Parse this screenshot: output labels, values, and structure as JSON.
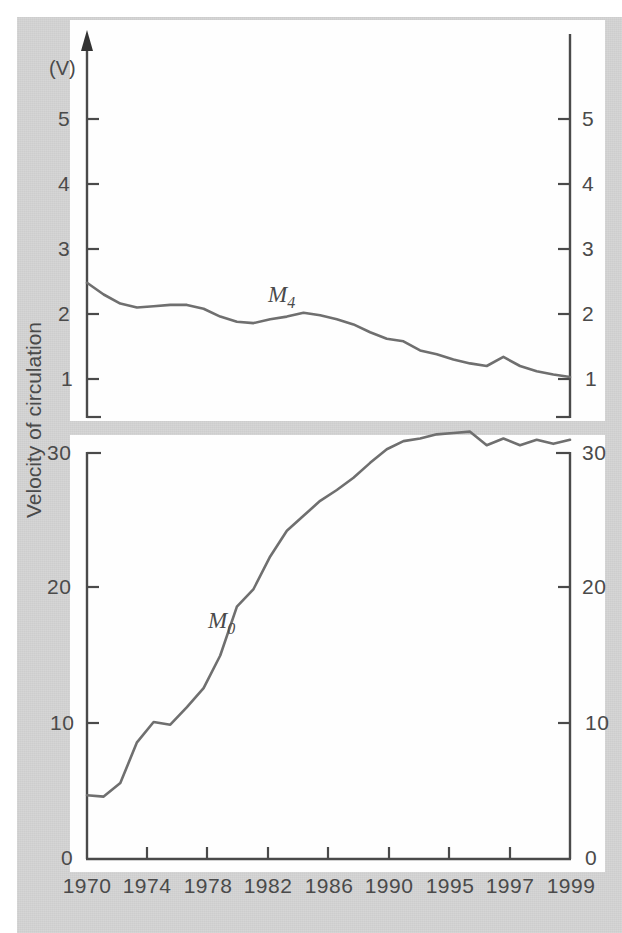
{
  "figure": {
    "y_axis_title": "Velocity of circulation",
    "unit_label": "(V)",
    "series_labels": {
      "m4": "M",
      "m4_sub": "4",
      "m0": "M",
      "m0_sub": "0"
    }
  },
  "axes": {
    "upper_y_ticks": [
      "5",
      "4",
      "3",
      "2",
      "1"
    ],
    "lower_y_ticks": [
      "30",
      "20",
      "10",
      "0"
    ],
    "x_ticks": [
      "1970",
      "1974",
      "1978",
      "1982",
      "1986",
      "1990",
      "1995",
      "1997",
      "1999"
    ]
  },
  "colors": {
    "paper": "#d4d4d4",
    "plot_background": "#fefefe",
    "axis": "#4a4a4a",
    "line": "#6f6f6f",
    "text": "#4a4a4a"
  },
  "chart_data": {
    "type": "line",
    "title": "",
    "xlabel": "",
    "ylabel": "Velocity of circulation",
    "unit": "(V)",
    "grid": false,
    "legend": "inline-labels",
    "broken_axis": true,
    "axis_note": "Two stacked panels with a broken y-axis: upper panel 1-5 for M4, lower panel 0-30+ for M0. Mirrored tick labels on left and right axes.",
    "x_axis": {
      "tick_labels": [
        "1970",
        "1974",
        "1978",
        "1982",
        "1986",
        "1990",
        "1995",
        "1997",
        "1999"
      ],
      "spacing": "even (categorical), not linear in time"
    },
    "panels": [
      {
        "name": "upper",
        "ylim": [
          1,
          5
        ],
        "yticks": [
          1,
          2,
          3,
          4,
          5
        ],
        "series": [
          {
            "name": "M4",
            "x": [
              1970,
              1971,
              1972,
              1973,
              1974,
              1975,
              1976,
              1977,
              1978,
              1979,
              1980,
              1981,
              1982,
              1983,
              1984,
              1985,
              1986,
              1987,
              1988,
              1989,
              1990,
              1991,
              1992,
              1993,
              1994,
              1995,
              1996,
              1997,
              1998,
              1999
            ],
            "values": [
              2.48,
              2.3,
              2.16,
              2.1,
              2.12,
              2.14,
              2.14,
              2.08,
              1.96,
              1.88,
              1.86,
              1.92,
              1.96,
              2.02,
              1.98,
              1.92,
              1.84,
              1.72,
              1.62,
              1.58,
              1.44,
              1.38,
              1.3,
              1.24,
              1.2,
              1.34,
              1.2,
              1.12,
              1.07,
              1.03
            ]
          }
        ]
      },
      {
        "name": "lower",
        "ylim": [
          0,
          32
        ],
        "yticks": [
          0,
          10,
          20,
          30
        ],
        "series": [
          {
            "name": "M0",
            "x": [
              1970,
              1971,
              1972,
              1973,
              1974,
              1975,
              1976,
              1977,
              1978,
              1979,
              1980,
              1981,
              1982,
              1983,
              1984,
              1985,
              1986,
              1987,
              1988,
              1989,
              1990,
              1991,
              1992,
              1993,
              1994,
              1995,
              1996,
              1997,
              1998,
              1999
            ],
            "values": [
              4.7,
              4.6,
              5.6,
              8.6,
              10.1,
              9.9,
              11.2,
              12.6,
              15.0,
              18.6,
              19.9,
              22.3,
              24.2,
              25.3,
              26.4,
              27.2,
              28.1,
              29.2,
              30.2,
              30.8,
              31.0,
              31.3,
              31.4,
              31.5,
              30.5,
              31.0,
              30.5,
              30.9,
              30.6,
              30.9
            ]
          }
        ]
      }
    ]
  }
}
